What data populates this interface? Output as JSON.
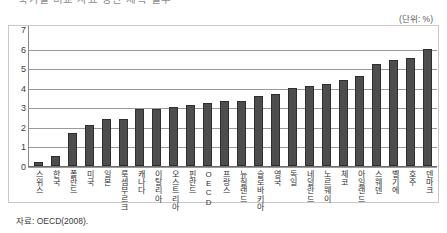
{
  "figure": {
    "caption_cutoff": "국가별 비교 자료 상단 제목 일부",
    "unit_label": "(단위: %)",
    "source_note": "자료: OECD(2008)."
  },
  "chart_data": {
    "type": "bar",
    "title": "",
    "subtitle": "",
    "xlabel": "",
    "ylabel": "",
    "unit": "%",
    "ylim": [
      0,
      7
    ],
    "yticks": [
      0,
      1,
      2,
      3,
      4,
      5,
      6,
      7
    ],
    "ytick_labels": [
      "0",
      "1",
      "2",
      "3",
      "4",
      "5",
      "6",
      "7"
    ],
    "grid": true,
    "legend": false,
    "bar_color": "#4d4d4d",
    "bar_edge_color": "#2e2e2e",
    "categories": [
      "스위스",
      "한국",
      "폴란드",
      "미국",
      "일본",
      "룩셈부르크",
      "캐나다",
      "이탈리아",
      "오스트리아",
      "핀란드",
      "OECD",
      "프랑스",
      "뉴질랜드",
      "슬로바키아",
      "영국",
      "독일",
      "네덜란드",
      "노르웨이",
      "체코",
      "아일랜드",
      "스웨덴",
      "벨기에",
      "호주",
      "덴마크"
    ],
    "values": [
      0.2,
      0.5,
      1.7,
      2.1,
      2.4,
      2.4,
      2.9,
      2.9,
      3.0,
      3.1,
      3.2,
      3.3,
      3.3,
      3.6,
      3.7,
      4.0,
      4.1,
      4.2,
      4.4,
      4.6,
      5.2,
      5.4,
      5.5,
      6.0
    ]
  }
}
